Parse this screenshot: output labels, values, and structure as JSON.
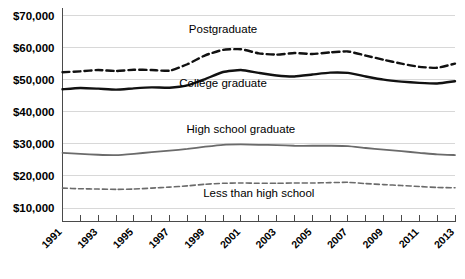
{
  "chart_data": {
    "type": "line",
    "title": "",
    "subtitle": "",
    "xlabel": "",
    "ylabel": "",
    "grid": true,
    "legend_position": "inline-labels",
    "ylim": [
      5000,
      70000
    ],
    "ytick_values": [
      70000,
      60000,
      50000,
      40000,
      30000,
      20000,
      10000
    ],
    "ytick_labels": [
      "$70,000",
      "$60,000",
      "$50,000",
      "$40,000",
      "$30,000",
      "$20,000",
      "$10,000"
    ],
    "x": [
      1991,
      1992,
      1993,
      1994,
      1995,
      1996,
      1997,
      1998,
      1999,
      2000,
      2001,
      2002,
      2003,
      2004,
      2005,
      2006,
      2007,
      2008,
      2009,
      2010,
      2011,
      2012,
      2013
    ],
    "xtick_labels": [
      "1991",
      "",
      "1993",
      "",
      "1995",
      "",
      "1997",
      "",
      "1999",
      "",
      "2001",
      "",
      "2003",
      "",
      "2005",
      "",
      "2007",
      "",
      "2009",
      "",
      "2011",
      "",
      "2013"
    ],
    "xtick_labels_shown": [
      "1991",
      "1993",
      "1995",
      "1997",
      "1999",
      "2001",
      "2003",
      "2005",
      "2007",
      "2009",
      "2011",
      "2013"
    ],
    "series": [
      {
        "name": "Postgraduate",
        "label": "Postgraduate",
        "style": "dashed",
        "color": "#111111",
        "width": 2.4,
        "dash": "7,4",
        "label_x": 2000,
        "label_y": 64500,
        "values": [
          52300,
          52600,
          53000,
          52700,
          53100,
          53000,
          52800,
          54800,
          57600,
          59300,
          59500,
          58200,
          57800,
          58300,
          58000,
          58500,
          58800,
          57500,
          56200,
          55000,
          54000,
          53700,
          55000
        ]
      },
      {
        "name": "College graduate",
        "label": "College graduate",
        "style": "solid",
        "color": "#111111",
        "width": 2.4,
        "dash": "",
        "label_x": 2000,
        "label_y": 47800,
        "values": [
          47000,
          47400,
          47200,
          46900,
          47300,
          47600,
          47500,
          48200,
          50200,
          52400,
          53000,
          52100,
          51300,
          51000,
          51600,
          52200,
          52100,
          51000,
          50000,
          49400,
          49000,
          48800,
          49500
        ]
      },
      {
        "name": "High school graduate",
        "label": "High school graduate",
        "style": "solid",
        "color": "#6b6b6b",
        "width": 1.8,
        "dash": "",
        "label_x": 2001,
        "label_y": 33500,
        "values": [
          27200,
          26900,
          26600,
          26500,
          26900,
          27400,
          27900,
          28400,
          29100,
          29700,
          29800,
          29700,
          29600,
          29400,
          29400,
          29400,
          29300,
          28700,
          28200,
          27700,
          27200,
          26700,
          26500
        ]
      },
      {
        "name": "Less than high school",
        "label": "Less than high school",
        "style": "dashed",
        "color": "#6b6b6b",
        "width": 1.6,
        "dash": "5,3",
        "label_x": 2002,
        "label_y": 13500,
        "values": [
          16200,
          16000,
          15900,
          15800,
          15900,
          16200,
          16500,
          16900,
          17400,
          17700,
          17800,
          17700,
          17700,
          17800,
          17800,
          17900,
          18000,
          17600,
          17300,
          17000,
          16700,
          16400,
          16300
        ]
      }
    ]
  }
}
